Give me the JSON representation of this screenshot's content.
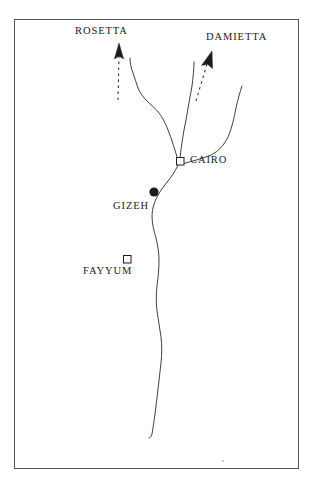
{
  "figure": {
    "kind": "line-drawing-map",
    "region": "Nile Delta and Lower Egypt",
    "background_color": "#ffffff",
    "ink_color": "#1c1c1c",
    "frame": {
      "visible": true,
      "x": 14,
      "y": 19,
      "width": 285,
      "height": 450,
      "stroke_color": "#555555",
      "stroke_width": 1
    }
  },
  "labels": {
    "rosetta": "ROSETTA",
    "damietta": "DAMIETTA",
    "cairo": "CAIRO",
    "gizeh": "GIZEH",
    "fayyum": "FAYYUM"
  },
  "markers": {
    "cairo": {
      "shape": "open-square",
      "x": 180,
      "y": 161,
      "size": 8
    },
    "gizeh": {
      "shape": "filled-circle",
      "x": 154,
      "y": 192,
      "radius": 5
    },
    "fayyum": {
      "shape": "open-square",
      "x": 127,
      "y": 259,
      "size": 8
    }
  },
  "arrows": {
    "rosetta": {
      "style": "dashed-shaft-solid-head",
      "direction": "up",
      "tail_x": 118,
      "tail_y": 100,
      "head_x": 119,
      "head_y": 46
    },
    "damietta": {
      "style": "dashed-shaft-solid-head",
      "direction": "up-right",
      "tail_x": 196,
      "tail_y": 101,
      "head_x": 211,
      "head_y": 53
    }
  },
  "rivers": {
    "rosetta_branch": "western distributary running from Cairo north-north-west toward Rosetta",
    "damietta_branch": "central distributary running from Cairo north toward Damietta",
    "eastern_branch": "eastern watercourse curving from the north-east down to Cairo",
    "main_nile": "main Nile channel running south from Cairo past Gizeh and Fayyum"
  },
  "colors": {
    "ink": "#1c1c1c",
    "frame": "#555555",
    "river": "#2a2a2a",
    "paper": "#ffffff"
  }
}
